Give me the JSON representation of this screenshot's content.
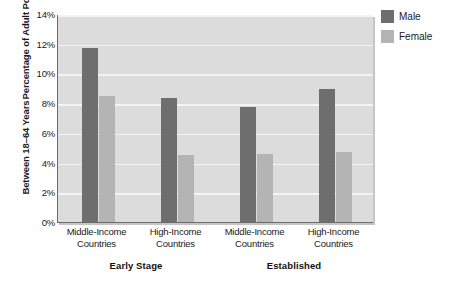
{
  "chart_data": {
    "type": "bar",
    "title": "",
    "subtitle": "",
    "xlabel": "",
    "ylabel": "Percentage of Adult Population Between 18–64 Years",
    "ylabel_lines": [
      "Percentage of Adult Population",
      "Between 18–64 Years"
    ],
    "ylim": [
      0,
      14
    ],
    "ytick_labels": [
      "0%",
      "2%",
      "4%",
      "6%",
      "8%",
      "10%",
      "12%",
      "14%"
    ],
    "ytick_values": [
      0,
      2,
      4,
      6,
      8,
      10,
      12,
      14
    ],
    "grid": true,
    "grid_axis": "y",
    "legend_position": "right-top",
    "categories": [
      "Middle-Income Countries",
      "High-Income Countries",
      "Middle-Income Countries",
      "High-Income Countries"
    ],
    "category_lines": [
      [
        "Middle-Income",
        "Countries"
      ],
      [
        "High-Income",
        "Countries"
      ],
      [
        "Middle-Income",
        "Countries"
      ],
      [
        "High-Income",
        "Countries"
      ]
    ],
    "groups": [
      {
        "label": "Early Stage",
        "categories": [
          0,
          1
        ]
      },
      {
        "label": "Established",
        "categories": [
          2,
          3
        ]
      }
    ],
    "series": [
      {
        "name": "Male",
        "color": "#6e6e6e",
        "values": [
          11.7,
          8.35,
          7.75,
          8.95
        ]
      },
      {
        "name": "Female",
        "color": "#b4b4b4",
        "values": [
          8.5,
          4.5,
          4.6,
          4.7
        ]
      }
    ]
  },
  "legend": {
    "items": [
      {
        "label": "Male",
        "color": "#6e6e6e"
      },
      {
        "label": "Female",
        "color": "#b4b4b4"
      }
    ]
  },
  "axis": {
    "y_title_line1": "Percentage of Adult Population",
    "y_title_line2": "Between 18–64 Years",
    "ticks": [
      "14%",
      "12%",
      "10%",
      "8%",
      "6%",
      "4%",
      "2%",
      "0%"
    ]
  },
  "x_categories": [
    {
      "line1": "Middle-Income",
      "line2": "Countries"
    },
    {
      "line1": "High-Income",
      "line2": "Countries"
    },
    {
      "line1": "Middle-Income",
      "line2": "Countries"
    },
    {
      "line1": "High-Income",
      "line2": "Countries"
    }
  ],
  "group_labels": [
    {
      "label": "Early Stage"
    },
    {
      "label": "Established"
    }
  ],
  "caption": {
    "text": ""
  },
  "colors": {
    "male": "#6e6e6e",
    "female": "#b4b4b4",
    "plot_background": "#dcdcdc",
    "gridline": "#f4f4f4",
    "axis_line": "#6b6b6b",
    "text": "#1a1a1a"
  }
}
